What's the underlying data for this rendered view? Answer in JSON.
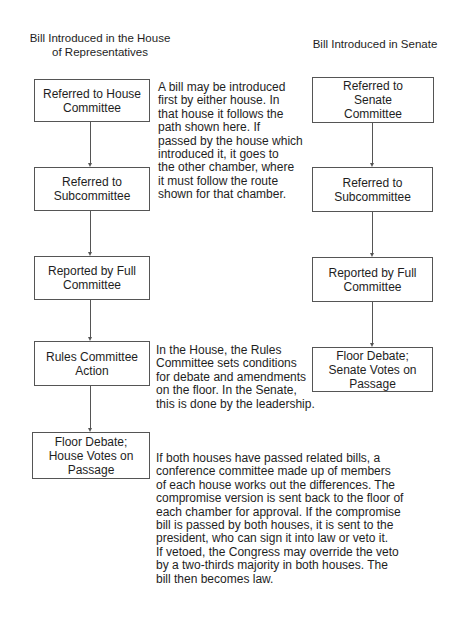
{
  "diagram": {
    "type": "flowchart",
    "house": {
      "heading": "Bill Introduced in the House\nof Representatives",
      "steps": [
        "Referred to House\nCommittee",
        "Referred to\nSubcommittee",
        "Reported by Full\nCommittee",
        "Rules Committee\nAction",
        "Floor Debate;\nHouse Votes on\nPassage"
      ]
    },
    "senate": {
      "heading": "Bill Introduced in Senate",
      "steps": [
        "Referred to\nSenate\nCommittee",
        "Referred to\nSubcommittee",
        "Reported by Full\nCommittee",
        "Floor Debate;\nSenate Votes on\nPassage"
      ]
    },
    "notes": {
      "introduction": "A bill may be introduced\nfirst by either house. In\nthat house it follows the\npath shown here.  If\npassed by the house which\nintroduced it, it goes to\nthe other chamber,  where\nit must follow the route\nshown for that chamber.",
      "rules": "In the House, the Rules\nCommittee sets conditions\nfor debate and amendments\non the floor.  In the Senate,\nthis is done by the leadership.",
      "conference": "If both houses have passed related bills, a\nconference committee made up of members\nof each house works out the differences.  The\ncompromise version is sent back to the floor of\neach chamber for approval.  If the compromise\nbill is passed by both houses, it is sent to the\npresident, who can sign it into law or veto it.\nIf vetoed, the Congress may override the veto\nby a two-thirds majority in both houses.  The\nbill then becomes law."
    },
    "colors": {
      "line": "#555555",
      "text": "#1e1e1e",
      "background": "#ffffff"
    }
  }
}
